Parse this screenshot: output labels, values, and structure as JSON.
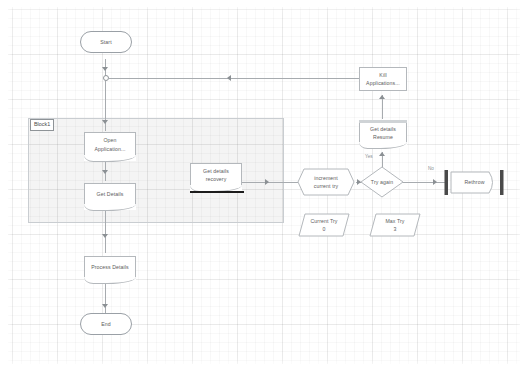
{
  "diagram": {
    "canvas": {
      "background": "#ffffff",
      "grid_minor_color": "#f2f2f2",
      "grid_major_color": "#ebebeb"
    },
    "block": {
      "label": "Block1",
      "fill": "#f0f0f0",
      "stroke": "#c9cdd1"
    },
    "nodes": [
      {
        "id": "start",
        "label": "Start",
        "shape": "terminator"
      },
      {
        "id": "open_app",
        "label": "Open\nApplication...",
        "shape": "document"
      },
      {
        "id": "get_details",
        "label": "Get Details",
        "shape": "document"
      },
      {
        "id": "process",
        "label": "Process Details",
        "shape": "document"
      },
      {
        "id": "end",
        "label": "End",
        "shape": "terminator"
      },
      {
        "id": "recovery",
        "label": "Get details\nrecovery",
        "shape": "document-bar"
      },
      {
        "id": "kill_app",
        "label": "Kill\nApplications...",
        "shape": "rectangle"
      },
      {
        "id": "resume",
        "label": "Get details\nResume",
        "shape": "document-head"
      },
      {
        "id": "increment",
        "label": "increment\ncurrent try",
        "shape": "preparation"
      },
      {
        "id": "try_again",
        "label": "Try again",
        "shape": "decision"
      },
      {
        "id": "rethrow",
        "label": "Rethrow",
        "shape": "terminator-bars"
      },
      {
        "id": "current_try",
        "label": "Current Try",
        "value": "0",
        "shape": "data"
      },
      {
        "id": "max_try",
        "label": "Max Try",
        "value": "3",
        "shape": "data"
      }
    ],
    "node_labels": {
      "start": "Start",
      "open_app_1": "Open",
      "open_app_2": "Application...",
      "get_details": "Get Details",
      "process": "Process Details",
      "end": "End",
      "recovery_1": "Get details",
      "recovery_2": "recovery",
      "kill_app_1": "Kill",
      "kill_app_2": "Applications...",
      "resume_1": "Get details",
      "resume_2": "Resume",
      "increment_1": "increment",
      "increment_2": "current try",
      "try_again": "Try again",
      "rethrow": "Rethrow",
      "current_try": "Current Try",
      "current_try_val": "0",
      "max_try": "Max Try",
      "max_try_val": "3"
    },
    "edge_labels": {
      "yes": "Yes",
      "no": "No"
    }
  }
}
